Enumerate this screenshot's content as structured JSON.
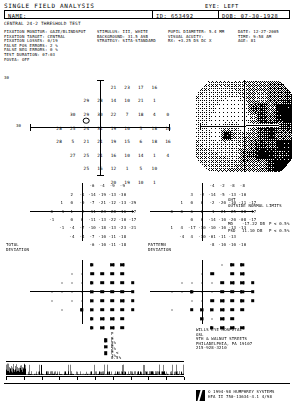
{
  "header": {
    "title": "SINGLE FIELD ANALYSIS",
    "eye_label": "EYE:",
    "eye_value": "LEFT",
    "name_label": "NAME:",
    "name_value": "",
    "id_label": "ID:",
    "id_value": "653492",
    "dob_label": "DOB:",
    "dob_value": "07-30-1928",
    "strategy_line": "CENTRAL 24-2 THRESHOLD TEST"
  },
  "params": {
    "col1": [
      "FIXATION MONITOR: GAZE/BLINDSPOT",
      "FIXATION TARGET: CENTRAL",
      "FIXATION LOSSES: 0/19",
      "FALSE POS ERRORS: 2 %",
      "FALSE NEG ERRORS: 0 %",
      "TEST DURATION: 07:03",
      "FOVEA: OFF"
    ],
    "col2": [
      "STIMULUS: III, WHITE",
      "BACKGROUND: 31.5 ASB",
      "STRATEGY: SITA-STANDARD"
    ],
    "col3": [
      "PUPIL DIAMETER: 5.4 MM",
      "VISUAL ACUITY:",
      "RX: +3.25 DS    DC X"
    ],
    "col4": [
      "DATE: 12-27-2005",
      "TIME: 9:58 AM",
      "AGE: 81"
    ]
  },
  "threshold_plot": {
    "label_top_left": "30",
    "axis_label_left": "30",
    "axis_label_right": "30",
    "values": [
      {
        "x": 1,
        "y": 3,
        "v": "21"
      },
      {
        "x": 2,
        "y": 3,
        "v": "23"
      },
      {
        "x": 3,
        "y": 3,
        "v": "17"
      },
      {
        "x": 4,
        "y": 3,
        "v": "16"
      },
      {
        "x": -1,
        "y": 2,
        "v": "29"
      },
      {
        "x": 0,
        "y": 2,
        "v": "28"
      },
      {
        "x": 1,
        "y": 2,
        "v": "14"
      },
      {
        "x": 2,
        "y": 2,
        "v": "10"
      },
      {
        "x": 3,
        "y": 2,
        "v": "21"
      },
      {
        "x": 4,
        "y": 2,
        "v": "1"
      },
      {
        "x": -2,
        "y": 1,
        "v": "30"
      },
      {
        "x": -1,
        "y": 1,
        "v": "29"
      },
      {
        "x": 0,
        "y": 1,
        "v": "30"
      },
      {
        "x": 1,
        "y": 1,
        "v": "22"
      },
      {
        "x": 2,
        "y": 1,
        "v": "7"
      },
      {
        "x": 3,
        "y": 1,
        "v": "18"
      },
      {
        "x": 4,
        "y": 1,
        "v": "4"
      },
      {
        "x": 5,
        "y": 1,
        "v": "0"
      },
      {
        "x": -3,
        "y": 0,
        "v": "28"
      },
      {
        "x": -2,
        "y": 0,
        "v": "25"
      },
      {
        "x": -1,
        "y": 0,
        "v": "24"
      },
      {
        "x": 0,
        "y": 0,
        "v": "31"
      },
      {
        "x": 1,
        "y": 0,
        "v": "19"
      },
      {
        "x": 2,
        "y": 0,
        "v": "10"
      },
      {
        "x": 3,
        "y": 0,
        "v": "5"
      },
      {
        "x": 4,
        "y": 0,
        "v": "18"
      },
      {
        "x": 5,
        "y": 0,
        "v": "10"
      },
      {
        "x": -3,
        "y": -1,
        "v": "28"
      },
      {
        "x": -2,
        "y": -1,
        "v": "5"
      },
      {
        "x": -1,
        "y": -1,
        "v": "21"
      },
      {
        "x": 0,
        "y": -1,
        "v": "21"
      },
      {
        "x": 1,
        "y": -1,
        "v": "19"
      },
      {
        "x": 2,
        "y": -1,
        "v": "15"
      },
      {
        "x": 3,
        "y": -1,
        "v": "6"
      },
      {
        "x": 4,
        "y": -1,
        "v": "18"
      },
      {
        "x": 5,
        "y": -1,
        "v": "16"
      },
      {
        "x": -2,
        "y": -2,
        "v": "27"
      },
      {
        "x": -1,
        "y": -2,
        "v": "25"
      },
      {
        "x": 0,
        "y": -2,
        "v": "21"
      },
      {
        "x": 1,
        "y": -2,
        "v": "16"
      },
      {
        "x": 2,
        "y": -2,
        "v": "10"
      },
      {
        "x": 3,
        "y": -2,
        "v": "14"
      },
      {
        "x": 4,
        "y": -2,
        "v": "1"
      },
      {
        "x": 5,
        "y": -2,
        "v": "4"
      },
      {
        "x": -1,
        "y": -3,
        "v": "25"
      },
      {
        "x": 0,
        "y": -3,
        "v": "16"
      },
      {
        "x": 1,
        "y": -3,
        "v": "12"
      },
      {
        "x": 2,
        "y": -3,
        "v": "1"
      },
      {
        "x": 3,
        "y": -3,
        "v": "5"
      },
      {
        "x": 4,
        "y": -3,
        "v": "10"
      },
      {
        "x": 1,
        "y": -4,
        "v": "20"
      },
      {
        "x": 2,
        "y": -4,
        "v": "19"
      },
      {
        "x": 3,
        "y": -4,
        "v": "10"
      },
      {
        "x": 4,
        "y": -4,
        "v": "1"
      }
    ]
  },
  "total_deviation": {
    "caption": "TOTAL\nDEVIATION",
    "values": [
      {
        "x": 1,
        "y": 3,
        "v": "-6"
      },
      {
        "x": 2,
        "y": 3,
        "v": "-4"
      },
      {
        "x": 3,
        "y": 3,
        "v": "-9"
      },
      {
        "x": 4,
        "y": 3,
        "v": "-9"
      },
      {
        "x": -1,
        "y": 2,
        "v": "2"
      },
      {
        "x": 0,
        "y": 2,
        "v": "-1"
      },
      {
        "x": 1,
        "y": 2,
        "v": "-14"
      },
      {
        "x": 2,
        "y": 2,
        "v": "-19"
      },
      {
        "x": 3,
        "y": 2,
        "v": "-13"
      },
      {
        "x": 4,
        "y": 2,
        "v": "-30"
      },
      {
        "x": -2,
        "y": 1,
        "v": "1"
      },
      {
        "x": -1,
        "y": 1,
        "v": "0"
      },
      {
        "x": 0,
        "y": 1,
        "v": "-0"
      },
      {
        "x": 1,
        "y": 1,
        "v": "-7"
      },
      {
        "x": 2,
        "y": 1,
        "v": "-21"
      },
      {
        "x": 3,
        "y": 1,
        "v": "-12"
      },
      {
        "x": 4,
        "y": 1,
        "v": "-13"
      },
      {
        "x": 5,
        "y": 1,
        "v": "-29"
      },
      {
        "x": -3,
        "y": 0,
        "v": "0"
      },
      {
        "x": -2,
        "y": 0,
        "v": "-1"
      },
      {
        "x": -1,
        "y": 0,
        "v": "1"
      },
      {
        "x": 0,
        "y": 0,
        "v": "-2"
      },
      {
        "x": 1,
        "y": 0,
        "v": "-11"
      },
      {
        "x": 2,
        "y": 0,
        "v": "-23"
      },
      {
        "x": 3,
        "y": 0,
        "v": "-28"
      },
      {
        "x": 4,
        "y": 0,
        "v": "-16"
      },
      {
        "x": 5,
        "y": 0,
        "v": "-17"
      },
      {
        "x": -3,
        "y": -1,
        "v": "-1"
      },
      {
        "x": -1,
        "y": -1,
        "v": "0"
      },
      {
        "x": 0,
        "y": -1,
        "v": "0"
      },
      {
        "x": 1,
        "y": -1,
        "v": "-11"
      },
      {
        "x": 2,
        "y": -1,
        "v": "-13"
      },
      {
        "x": 3,
        "y": -1,
        "v": "-22"
      },
      {
        "x": 4,
        "y": -1,
        "v": "-10"
      },
      {
        "x": 5,
        "y": -1,
        "v": "-17"
      },
      {
        "x": -2,
        "y": -2,
        "v": "-1"
      },
      {
        "x": -1,
        "y": -2,
        "v": "-4"
      },
      {
        "x": 0,
        "y": -2,
        "v": "-7"
      },
      {
        "x": 1,
        "y": -2,
        "v": "-10"
      },
      {
        "x": 2,
        "y": -2,
        "v": "-18"
      },
      {
        "x": 3,
        "y": -2,
        "v": "-13"
      },
      {
        "x": 4,
        "y": -2,
        "v": "-23"
      },
      {
        "x": 5,
        "y": -2,
        "v": "-21"
      },
      {
        "x": -1,
        "y": -3,
        "v": "-4"
      },
      {
        "x": 0,
        "y": -3,
        "v": "-4"
      },
      {
        "x": 1,
        "y": -3,
        "v": "-7"
      },
      {
        "x": 2,
        "y": -3,
        "v": "-10"
      },
      {
        "x": 3,
        "y": -3,
        "v": "-11"
      },
      {
        "x": 4,
        "y": -3,
        "v": "-18"
      },
      {
        "x": 1,
        "y": -4,
        "v": "-6"
      },
      {
        "x": 2,
        "y": -4,
        "v": "-10"
      },
      {
        "x": 3,
        "y": -4,
        "v": "-11"
      },
      {
        "x": 4,
        "y": -4,
        "v": "-18"
      }
    ]
  },
  "pattern_deviation": {
    "caption": "PATTERN\nDEVIATION",
    "values": [
      {
        "x": 1,
        "y": 3,
        "v": "-4"
      },
      {
        "x": 2,
        "y": 3,
        "v": "-2"
      },
      {
        "x": 3,
        "y": 3,
        "v": "-8"
      },
      {
        "x": 4,
        "y": 3,
        "v": "-8"
      },
      {
        "x": -1,
        "y": 2,
        "v": "3"
      },
      {
        "x": 0,
        "y": 2,
        "v": "-2"
      },
      {
        "x": 1,
        "y": 2,
        "v": "-14"
      },
      {
        "x": 2,
        "y": 2,
        "v": "-5"
      },
      {
        "x": 3,
        "y": 2,
        "v": "-13"
      },
      {
        "x": 4,
        "y": 2,
        "v": "-10"
      },
      {
        "x": -2,
        "y": 1,
        "v": "1"
      },
      {
        "x": -1,
        "y": 1,
        "v": "0"
      },
      {
        "x": 0,
        "y": 1,
        "v": "0"
      },
      {
        "x": 1,
        "y": 1,
        "v": "-2"
      },
      {
        "x": 2,
        "y": 1,
        "v": "-20"
      },
      {
        "x": 3,
        "y": 1,
        "v": "-10"
      },
      {
        "x": 4,
        "y": 1,
        "v": "-11"
      },
      {
        "x": 5,
        "y": 1,
        "v": "-17"
      },
      {
        "x": -3,
        "y": 0,
        "v": "0"
      },
      {
        "x": -2,
        "y": 0,
        "v": "0"
      },
      {
        "x": -1,
        "y": 0,
        "v": "6"
      },
      {
        "x": 0,
        "y": 0,
        "v": "2"
      },
      {
        "x": 1,
        "y": 0,
        "v": "-1"
      },
      {
        "x": 2,
        "y": 0,
        "v": "-21"
      },
      {
        "x": 3,
        "y": 0,
        "v": "-25"
      },
      {
        "x": 4,
        "y": 0,
        "v": "-08"
      },
      {
        "x": 5,
        "y": 0,
        "v": "-17"
      },
      {
        "x": -1,
        "y": -1,
        "v": "0"
      },
      {
        "x": 0,
        "y": -1,
        "v": "0"
      },
      {
        "x": 1,
        "y": -1,
        "v": "-14"
      },
      {
        "x": 2,
        "y": -1,
        "v": "-10"
      },
      {
        "x": 3,
        "y": -1,
        "v": "-20"
      },
      {
        "x": 4,
        "y": -1,
        "v": "-08"
      },
      {
        "x": 5,
        "y": -1,
        "v": "-17"
      },
      {
        "x": -3,
        "y": -2,
        "v": "1"
      },
      {
        "x": -2,
        "y": -2,
        "v": "4"
      },
      {
        "x": -1,
        "y": -2,
        "v": "-17"
      },
      {
        "x": 0,
        "y": -2,
        "v": "-10"
      },
      {
        "x": 1,
        "y": -2,
        "v": "-10"
      },
      {
        "x": 2,
        "y": -2,
        "v": "-10"
      },
      {
        "x": 3,
        "y": -2,
        "v": "-13"
      },
      {
        "x": 4,
        "y": -2,
        "v": "-13"
      },
      {
        "x": -2,
        "y": -3,
        "v": "-4"
      },
      {
        "x": -1,
        "y": -3,
        "v": "4"
      },
      {
        "x": 0,
        "y": -3,
        "v": "-10"
      },
      {
        "x": 1,
        "y": -3,
        "v": "-01"
      },
      {
        "x": 2,
        "y": -3,
        "v": "-11"
      },
      {
        "x": 3,
        "y": -3,
        "v": "-13"
      },
      {
        "x": 1,
        "y": -4,
        "v": "-8"
      },
      {
        "x": 2,
        "y": -4,
        "v": "-10"
      },
      {
        "x": 3,
        "y": -4,
        "v": "-10"
      },
      {
        "x": 4,
        "y": -4,
        "v": "-10"
      }
    ]
  },
  "ght": {
    "label": "GHT",
    "value": "OUTSIDE NORMAL LIMITS"
  },
  "indices": {
    "md_label": "MD",
    "md_value": "-17.22 DB",
    "md_p": "P < 0.5%",
    "psd_label": "PSD",
    "psd_value": "11.10 DB",
    "psd_p": "P < 0.5%"
  },
  "legend": {
    "rows": [
      {
        "sym": "sym-5",
        "text": "P < 5%"
      },
      {
        "sym": "sym-2",
        "text": "P < 2%"
      },
      {
        "sym": "sym-1",
        "text": "P < 1%"
      },
      {
        "sym": "sym-05",
        "text": "P < 0.5%"
      }
    ]
  },
  "clinic": {
    "lines": [
      "WILLS EYE HOSPITAL",
      "GSL",
      "9TH & WALNUT STREETS",
      "PHILADELPHIA, PA   19107",
      "215-928-3210"
    ]
  },
  "footer": {
    "line1": "© 1994-98 HUMPHREY SYSTEMS",
    "line2": "HFA II 750-13634-4.1   4/98",
    "logo_name": "zeiss-humphrey-logo"
  },
  "colors": {
    "ink": "#000000",
    "paper": "#ffffff"
  }
}
